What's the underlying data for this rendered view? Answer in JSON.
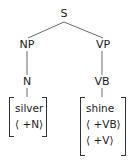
{
  "tree": {
    "root": {
      "label": "S"
    },
    "np": {
      "label": "NP"
    },
    "vp": {
      "label": "VP"
    },
    "n": {
      "label": "N"
    },
    "vb": {
      "label": "VB"
    }
  },
  "lexicon": {
    "left": {
      "word": "silver",
      "features": [
        "⟨ +N⟩"
      ]
    },
    "right": {
      "word": "shine",
      "features": [
        "⟨ +VB⟩",
        "⟨ +V⟩"
      ]
    }
  },
  "colors": {
    "line": "#333333",
    "text": "#1a1a1a",
    "background": "#ffffff"
  }
}
